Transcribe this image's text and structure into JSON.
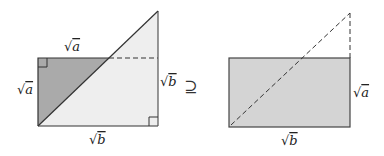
{
  "diagram": {
    "left_figure": {
      "labels": {
        "top": "a",
        "left": "a",
        "right": "b",
        "bottom": "b"
      },
      "colors": {
        "dark_triangle": "#aaaaaa",
        "light_fill": "#eeeeee",
        "stroke": "#333333"
      }
    },
    "relation_symbol": "⊇",
    "right_figure": {
      "labels": {
        "right": "a",
        "bottom": "b"
      },
      "colors": {
        "rect_fill": "#d4d4d4",
        "stroke": "#333333"
      }
    },
    "radical": "√"
  }
}
